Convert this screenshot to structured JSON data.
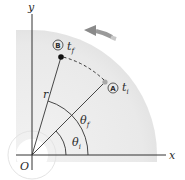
{
  "diagram": {
    "axes": {
      "x_label": "x",
      "y_label": "y",
      "origin_label": "O"
    },
    "points": [
      {
        "id": "A",
        "marker": "A",
        "time_label": "t",
        "time_sub": "i",
        "color": "#a8a8a8"
      },
      {
        "id": "B",
        "marker": "B",
        "time_label": "t",
        "time_sub": "f",
        "color": "#111111"
      }
    ],
    "radius_label": "r",
    "angles": [
      {
        "id": "theta_i",
        "label": "θ",
        "sub": "i"
      },
      {
        "id": "theta_f",
        "label": "θ",
        "sub": "f"
      }
    ],
    "rotation_direction": "counterclockwise",
    "colors": {
      "disk_fill": "#ececec",
      "axis": "#333333",
      "arrow": "#8a8a8a",
      "dashed_path": "#333333",
      "hub": "#ffffff"
    }
  }
}
